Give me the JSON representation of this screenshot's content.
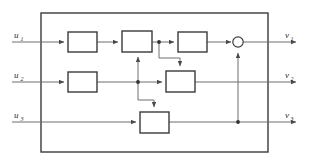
{
  "diagram": {
    "type": "block-diagram",
    "canvas": {
      "width": 310,
      "height": 164
    },
    "colors": {
      "background": "#ffffff",
      "block_stroke": "#3a3a3a",
      "block_fill": "#ffffff",
      "wire": "#6f6f6f",
      "wire_dark": "#4a4a4a",
      "junction": "#333333",
      "label_text": "#2b2b2b"
    },
    "outer_frame": {
      "x": 41,
      "y": 13,
      "width": 227,
      "height": 139
    },
    "inputs": [
      {
        "id": "u1",
        "base": "u",
        "sub": "1",
        "x": 14,
        "y": 36,
        "wire_y": 42
      },
      {
        "id": "u2",
        "base": "u",
        "sub": "2",
        "x": 14,
        "y": 76,
        "wire_y": 82
      },
      {
        "id": "u3",
        "base": "u",
        "sub": "3",
        "x": 14,
        "y": 116,
        "wire_y": 122
      }
    ],
    "outputs": [
      {
        "id": "v1",
        "base": "v",
        "sub": "1",
        "x": 285,
        "y": 36,
        "wire_y": 42
      },
      {
        "id": "v2",
        "base": "v",
        "sub": "2",
        "x": 285,
        "y": 76,
        "wire_y": 82
      },
      {
        "id": "v3",
        "base": "v",
        "sub": "3",
        "x": 285,
        "y": 116,
        "wire_y": 122
      }
    ],
    "blocks": [
      {
        "id": "block-r1-c1",
        "row": 1,
        "col": 1,
        "x": 68,
        "y": 32,
        "width": 29,
        "height": 20,
        "label": ""
      },
      {
        "id": "block-r1-c2",
        "row": 1,
        "col": 2,
        "x": 122,
        "y": 31,
        "width": 30,
        "height": 21,
        "label": ""
      },
      {
        "id": "block-r1-c3",
        "row": 1,
        "col": 3,
        "x": 178,
        "y": 32,
        "width": 29,
        "height": 20,
        "label": ""
      },
      {
        "id": "block-r2-c1",
        "row": 2,
        "col": 1,
        "x": 68,
        "y": 72,
        "width": 29,
        "height": 20,
        "label": ""
      },
      {
        "id": "block-r2-c2",
        "row": 2,
        "col": 2,
        "x": 166,
        "y": 71,
        "width": 29,
        "height": 21,
        "label": ""
      },
      {
        "id": "block-r3-c1",
        "row": 3,
        "col": 1,
        "x": 140,
        "y": 112,
        "width": 29,
        "height": 21,
        "label": ""
      }
    ],
    "summing_node": {
      "id": "sum-1",
      "cx": 238,
      "cy": 42,
      "r": 5.2
    },
    "junctions": [
      {
        "id": "junction-row1-tap",
        "cx": 159,
        "cy": 42
      },
      {
        "id": "junction-row2-tap",
        "cx": 138,
        "cy": 82
      },
      {
        "id": "junction-row3-tap",
        "cx": 238,
        "cy": 122
      }
    ],
    "connections": [
      {
        "id": "wire-u1-in",
        "from": "u1",
        "to": "block-r1-c1",
        "kind": "straight"
      },
      {
        "id": "wire-r1c1-r1c2",
        "from": "block-r1-c1",
        "to": "block-r1-c2",
        "kind": "straight"
      },
      {
        "id": "wire-r1c2-r1c3",
        "from": "block-r1-c2",
        "to": "block-r1-c3",
        "kind": "straight"
      },
      {
        "id": "wire-r1c3-sum",
        "from": "block-r1-c3",
        "to": "sum-1",
        "kind": "straight"
      },
      {
        "id": "wire-sum-v1",
        "from": "sum-1",
        "to": "v1",
        "kind": "straight"
      },
      {
        "id": "wire-u2-in",
        "from": "u2",
        "to": "block-r2-c1",
        "kind": "straight"
      },
      {
        "id": "wire-r2c1-r2c2",
        "from": "block-r2-c1",
        "to": "block-r2-c2",
        "kind": "straight"
      },
      {
        "id": "wire-r2c2-v2",
        "from": "block-r2-c2",
        "to": "v2",
        "kind": "straight"
      },
      {
        "id": "wire-u3-in",
        "from": "u3",
        "to": "block-r3-c1",
        "kind": "straight"
      },
      {
        "id": "wire-r3c1-v3",
        "from": "block-r3-c1",
        "to": "v3",
        "kind": "straight"
      },
      {
        "id": "wire-cross-row2-to-row1",
        "from": "junction-row2-tap",
        "to": "block-r1-c2",
        "kind": "vertical-up"
      },
      {
        "id": "wire-cross-row1-to-row2",
        "from": "junction-row1-tap",
        "to": "block-r2-c2",
        "kind": "step-down"
      },
      {
        "id": "wire-cross-row2-to-row3",
        "from": "junction-row2-tap",
        "to": "block-r3-c1",
        "kind": "step-down"
      },
      {
        "id": "wire-feedback-row3-to-sum",
        "from": "junction-row3-tap",
        "to": "sum-1",
        "kind": "vertical-up"
      }
    ]
  }
}
